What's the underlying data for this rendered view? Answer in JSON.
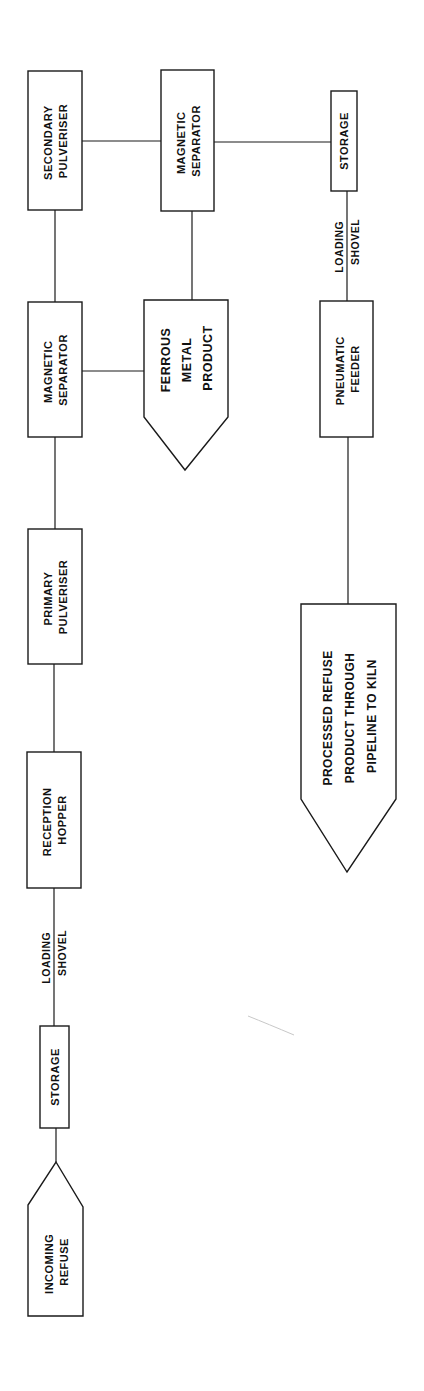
{
  "diagram": {
    "orientation": "rotated-90-ccw",
    "nodes": {
      "incoming_refuse": {
        "line1": "INCOMING",
        "line2": "REFUSE"
      },
      "storage_1": {
        "line1": "STORAGE"
      },
      "reception_hopper": {
        "line1": "RECEPTION",
        "line2": "HOPPER"
      },
      "primary_pulveriser": {
        "line1": "PRIMARY",
        "line2": "PULVERISER"
      },
      "magnetic_separator_1": {
        "line1": "MAGNETIC",
        "line2": "SEPARATOR"
      },
      "secondary_pulveriser": {
        "line1": "SECONDARY",
        "line2": "PULVERISER"
      },
      "magnetic_separator_2": {
        "line1": "MAGNETIC",
        "line2": "SEPARATOR"
      },
      "ferrous_metal_product": {
        "line1": "FERROUS",
        "line2": "METAL",
        "line3": "PRODUCT"
      },
      "storage_2": {
        "line1": "STORAGE"
      },
      "pneumatic_feeder": {
        "line1": "PNEUMATIC",
        "line2": "FEEDER"
      },
      "processed_refuse": {
        "line1": "PROCESSED REFUSE",
        "line2": "PRODUCT THROUGH",
        "line3": "PIPELINE TO KILN"
      }
    },
    "edge_labels": {
      "loading_shovel_1": {
        "line1": "LOADING",
        "line2": "SHOVEL"
      },
      "loading_shovel_2": {
        "line1": "LOADING",
        "line2": "SHOVEL"
      }
    },
    "edges": [
      [
        "incoming_refuse",
        "storage_1"
      ],
      [
        "storage_1",
        "reception_hopper",
        "loading_shovel_1"
      ],
      [
        "reception_hopper",
        "primary_pulveriser"
      ],
      [
        "primary_pulveriser",
        "magnetic_separator_1"
      ],
      [
        "magnetic_separator_1",
        "ferrous_metal_product"
      ],
      [
        "magnetic_separator_1",
        "secondary_pulveriser"
      ],
      [
        "secondary_pulveriser",
        "magnetic_separator_2"
      ],
      [
        "magnetic_separator_2",
        "ferrous_metal_product"
      ],
      [
        "magnetic_separator_2",
        "storage_2"
      ],
      [
        "storage_2",
        "pneumatic_feeder",
        "loading_shovel_2"
      ],
      [
        "pneumatic_feeder",
        "processed_refuse"
      ]
    ],
    "colors": {
      "stroke": "#1a1a1a",
      "text": "#111111",
      "background": "#ffffff"
    }
  }
}
